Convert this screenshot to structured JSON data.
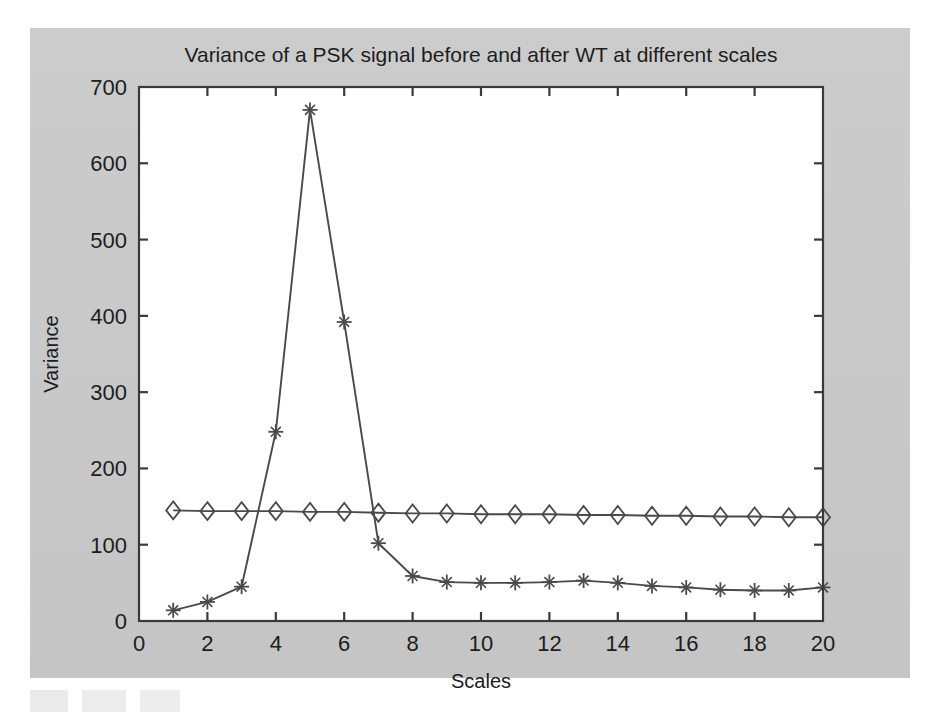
{
  "figure": {
    "background_color": "#c9c9c9",
    "plot_background_color": "#ffffff",
    "axis_color": "#3a3a3a",
    "series_color": "#4a4a4a"
  },
  "chart_data": {
    "type": "line",
    "title": "Variance of a PSK signal before and after WT at different scales",
    "xlabel": "Scales",
    "ylabel": "Variance",
    "xlim": [
      0,
      20
    ],
    "ylim": [
      0,
      700
    ],
    "xticks": [
      0,
      2,
      4,
      6,
      8,
      10,
      12,
      14,
      16,
      18,
      20
    ],
    "xtick_labels": [
      "0",
      "2",
      "4",
      "6",
      "8",
      "10",
      "12",
      "14",
      "16",
      "18",
      "20"
    ],
    "yticks": [
      0,
      100,
      200,
      300,
      400,
      500,
      600,
      700
    ],
    "ytick_labels": [
      "0",
      "100",
      "200",
      "300",
      "400",
      "500",
      "600",
      "700"
    ],
    "grid": false,
    "legend": null,
    "x": [
      1,
      2,
      3,
      4,
      5,
      6,
      7,
      8,
      9,
      10,
      11,
      12,
      13,
      14,
      15,
      16,
      17,
      18,
      19,
      20
    ],
    "series": [
      {
        "name": "Variance after WT",
        "marker": "star",
        "values": [
          14,
          25,
          45,
          248,
          670,
          392,
          102,
          59,
          51,
          50,
          50,
          51,
          53,
          50,
          46,
          44,
          41,
          40,
          40,
          44
        ]
      },
      {
        "name": "Variance before WT",
        "marker": "diamond",
        "values": [
          145,
          144,
          144,
          144,
          143,
          143,
          142,
          141,
          141,
          140,
          140,
          140,
          139,
          139,
          138,
          138,
          137,
          137,
          136,
          136
        ]
      }
    ]
  }
}
